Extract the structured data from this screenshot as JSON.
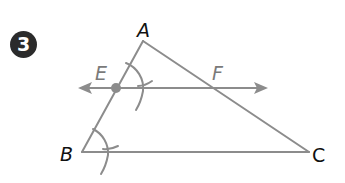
{
  "problem": {
    "number": "3"
  },
  "diagram": {
    "colors": {
      "stroke": "#8c8c8c",
      "point": "#8c8c8c",
      "badge_bg": "#2b2b2b",
      "vertex_label": "#111111",
      "construction_label": "#7a7a7a"
    },
    "triangle": {
      "vertices": {
        "A": {
          "label": "A",
          "x": 143,
          "y": 41
        },
        "B": {
          "label": "B",
          "x": 82,
          "y": 152
        },
        "C": {
          "label": "C",
          "x": 309,
          "y": 152
        }
      }
    },
    "parallel_line": {
      "points": {
        "E": {
          "label": "E",
          "x": 116,
          "y": 88
        },
        "F": {
          "label": "F",
          "x": 213,
          "y": 88
        }
      },
      "arrow_left_x": 78,
      "arrow_right_x": 268,
      "description": "Line through E and F parallel to BC, with arrows at both ends"
    },
    "construction_arcs": [
      "Arc centered at B crossing BA and BC",
      "Arc centered at E crossing EA and line EF (copied angle)"
    ]
  }
}
